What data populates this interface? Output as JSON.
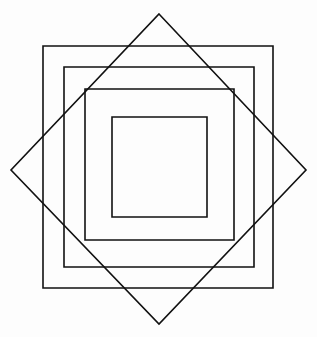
{
  "figure": {
    "title": "Concentric squares with rotated square (diamond) overlay",
    "canvas": {
      "width": 317,
      "height": 337,
      "background_color": "#fdfdfd"
    },
    "stroke": {
      "color": "#111111",
      "width": 1.6,
      "fill": "none"
    },
    "shapes": [
      {
        "name": "outer-square",
        "kind": "rectangle",
        "label": "Outermost rectangle",
        "x": 43,
        "y": 46,
        "width": 230,
        "height": 242,
        "points": "43,46 273,46 273,288 43,288"
      },
      {
        "name": "second-square",
        "kind": "rectangle",
        "label": "Second rectangle",
        "x": 64,
        "y": 67,
        "width": 190,
        "height": 200,
        "points": "64,67 254,67 254,267 64,267"
      },
      {
        "name": "third-square",
        "kind": "rectangle",
        "label": "Third rectangle, corners touch the diamond edges",
        "x": 85,
        "y": 89,
        "width": 149,
        "height": 151,
        "points": "85,89 234,89 234,240 85,240"
      },
      {
        "name": "inner-square",
        "kind": "rectangle",
        "label": "Innermost rectangle",
        "x": 112,
        "y": 117,
        "width": 95,
        "height": 100,
        "points": "112,117 207,117 207,217 112,217"
      },
      {
        "name": "diamond",
        "kind": "polygon",
        "label": "Rotated square (diamond)",
        "points": "159,14 306,170 159,324 11,170",
        "vertices": {
          "top": [
            159,
            14
          ],
          "right": [
            306,
            170
          ],
          "bottom": [
            159,
            324
          ],
          "left": [
            11,
            170
          ]
        }
      }
    ]
  }
}
